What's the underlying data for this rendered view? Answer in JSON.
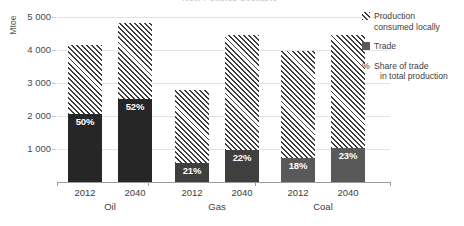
{
  "chart_data": {
    "type": "bar",
    "title": "New Policies Scenario",
    "ylabel": "Mtoe",
    "xlabel": "",
    "ylim": [
      0,
      5000
    ],
    "yticks": [
      0,
      1000,
      2000,
      3000,
      4000,
      5000
    ],
    "ytick_labels": [
      "",
      "1 000",
      "2 000",
      "3 000",
      "4 000",
      "5 000"
    ],
    "grid": true,
    "stacked": true,
    "legend_position": "right",
    "groups": [
      "Oil",
      "Gas",
      "Coal"
    ],
    "categories": [
      "2012",
      "2040",
      "2012",
      "2040",
      "2012",
      "2040"
    ],
    "series": [
      {
        "name": "Trade",
        "values": [
          2075,
          2510,
          580,
          980,
          715,
          1030
        ]
      },
      {
        "name": "Production consumed locally",
        "values": [
          2075,
          2320,
          2220,
          3470,
          3255,
          3430
        ]
      }
    ],
    "totals": [
      4150,
      4830,
      2800,
      4450,
      3970,
      4460
    ],
    "data_labels": [
      "50%",
      "52%",
      "21%",
      "22%",
      "18%",
      "23%"
    ],
    "bars": [
      {
        "group": "Oil",
        "year": "2012",
        "total": 4150,
        "trade": 2075,
        "local": 2075,
        "pct": "50%",
        "trade_color": "#262626"
      },
      {
        "group": "Oil",
        "year": "2040",
        "total": 4830,
        "trade": 2510,
        "local": 2320,
        "pct": "52%",
        "trade_color": "#262626"
      },
      {
        "group": "Gas",
        "year": "2012",
        "total": 2800,
        "trade": 580,
        "local": 2220,
        "pct": "21%",
        "trade_color": "#3f3f3f"
      },
      {
        "group": "Gas",
        "year": "2040",
        "total": 4450,
        "trade": 980,
        "local": 3470,
        "pct": "22%",
        "trade_color": "#3f3f3f"
      },
      {
        "group": "Coal",
        "year": "2012",
        "total": 3970,
        "trade": 715,
        "local": 3255,
        "pct": "18%",
        "trade_color": "#595959"
      },
      {
        "group": "Coal",
        "year": "2040",
        "total": 4460,
        "trade": 1030,
        "local": 3430,
        "pct": "23%",
        "trade_color": "#595959"
      }
    ],
    "legend": [
      {
        "marker": "hatched",
        "label_line1": "Production",
        "label_line2": "consumed locally"
      },
      {
        "marker": "solid",
        "label_line1": "Trade",
        "label_line2": ""
      },
      {
        "marker": "percent",
        "label_line1": "Share of trade",
        "label_line2": "in total production",
        "symbol": "%"
      }
    ],
    "colors": {
      "hatch_stroke": "#3d3d3d",
      "trade_oil": "#262626",
      "trade_gas": "#3f3f3f",
      "trade_coal": "#595959",
      "gridline": "#e3e3e3",
      "axis": "#9a9a9a",
      "text": "#404040",
      "label_text": "#ffffff"
    }
  }
}
